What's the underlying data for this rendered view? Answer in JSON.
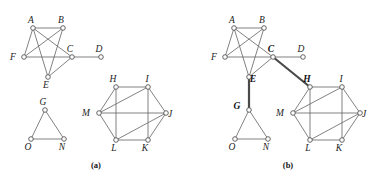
{
  "figure": {
    "width": 384,
    "height": 179,
    "background": "#ffffff",
    "edge_color": "#6b6b6b",
    "bold_edge_color": "#4a4a4a",
    "node_fill": "#ffffff",
    "node_stroke": "#555555",
    "label_color": "#1d1d1d"
  },
  "panels": [
    {
      "id": "panel-a",
      "caption": "(a)",
      "caption_pos": {
        "x": 96,
        "y": 168
      },
      "components": [
        {
          "id": "component-a-abcdef",
          "nodes": [
            {
              "id": "A",
              "label": "A",
              "x": 33,
              "y": 28,
              "bold": false,
              "label_dx": -2,
              "label_dy": -5
            },
            {
              "id": "B",
              "label": "B",
              "x": 63,
              "y": 28,
              "bold": false,
              "label_dx": -2,
              "label_dy": -5
            },
            {
              "id": "C",
              "label": "C",
              "x": 72,
              "y": 57,
              "bold": false,
              "label_dx": -2,
              "label_dy": -5
            },
            {
              "id": "D",
              "label": "D",
              "x": 101,
              "y": 57,
              "bold": false,
              "label_dx": -2,
              "label_dy": -5
            },
            {
              "id": "E",
              "label": "E",
              "x": 48,
              "y": 77,
              "bold": false,
              "label_dx": -2,
              "label_dy": 11
            },
            {
              "id": "F",
              "label": "F",
              "x": 24,
              "y": 57,
              "bold": false,
              "label_dx": -11,
              "label_dy": 3
            }
          ],
          "edges": [
            {
              "from": "A",
              "to": "B",
              "bold": false
            },
            {
              "from": "A",
              "to": "F",
              "bold": false
            },
            {
              "from": "A",
              "to": "C",
              "bold": false
            },
            {
              "from": "A",
              "to": "E",
              "bold": false
            },
            {
              "from": "B",
              "to": "F",
              "bold": false
            },
            {
              "from": "B",
              "to": "E",
              "bold": false
            },
            {
              "from": "F",
              "to": "C",
              "bold": false
            },
            {
              "from": "C",
              "to": "E",
              "bold": false
            },
            {
              "from": "C",
              "to": "D",
              "bold": false
            }
          ]
        },
        {
          "id": "component-a-gon",
          "nodes": [
            {
              "id": "G",
              "label": "G",
              "x": 45,
              "y": 110,
              "bold": false,
              "label_dx": -2,
              "label_dy": -5
            },
            {
              "id": "O",
              "label": "O",
              "x": 31,
              "y": 139,
              "bold": false,
              "label_dx": -3,
              "label_dy": 11
            },
            {
              "id": "N",
              "label": "N",
              "x": 64,
              "y": 139,
              "bold": false,
              "label_dx": -2,
              "label_dy": 11
            }
          ],
          "edges": [
            {
              "from": "G",
              "to": "O",
              "bold": false
            },
            {
              "from": "G",
              "to": "N",
              "bold": false
            },
            {
              "from": "O",
              "to": "N",
              "bold": false
            }
          ]
        },
        {
          "id": "component-a-hexagon",
          "nodes": [
            {
              "id": "H",
              "label": "H",
              "x": 116,
              "y": 87,
              "bold": false,
              "label_dx": -3,
              "label_dy": -5
            },
            {
              "id": "I",
              "label": "I",
              "x": 148,
              "y": 87,
              "bold": false,
              "label_dx": -1,
              "label_dy": -5
            },
            {
              "id": "J",
              "label": "J",
              "x": 166,
              "y": 113,
              "bold": false,
              "label_dx": 4,
              "label_dy": 4
            },
            {
              "id": "K",
              "label": "K",
              "x": 148,
              "y": 140,
              "bold": false,
              "label_dx": -3,
              "label_dy": 11
            },
            {
              "id": "L",
              "label": "L",
              "x": 116,
              "y": 140,
              "bold": false,
              "label_dx": -2,
              "label_dy": 11
            },
            {
              "id": "M",
              "label": "M",
              "x": 99,
              "y": 113,
              "bold": false,
              "label_dx": -13,
              "label_dy": 3
            }
          ],
          "edges": [
            {
              "from": "H",
              "to": "I",
              "bold": false
            },
            {
              "from": "I",
              "to": "J",
              "bold": false
            },
            {
              "from": "J",
              "to": "K",
              "bold": false
            },
            {
              "from": "K",
              "to": "L",
              "bold": false
            },
            {
              "from": "L",
              "to": "M",
              "bold": false
            },
            {
              "from": "M",
              "to": "H",
              "bold": false
            },
            {
              "from": "M",
              "to": "I",
              "bold": false
            },
            {
              "from": "M",
              "to": "J",
              "bold": false
            },
            {
              "from": "H",
              "to": "L",
              "bold": false
            },
            {
              "from": "I",
              "to": "K",
              "bold": false
            },
            {
              "from": "L",
              "to": "J",
              "bold": false
            }
          ]
        }
      ]
    },
    {
      "id": "panel-b",
      "caption": "(b)",
      "caption_pos": {
        "x": 288,
        "y": 168
      },
      "components": [
        {
          "id": "component-b-tree",
          "nodes": [
            {
              "id": "A",
              "label": "A",
              "x": 234,
              "y": 28,
              "bold": false,
              "label_dx": -2,
              "label_dy": -5
            },
            {
              "id": "B",
              "label": "B",
              "x": 264,
              "y": 28,
              "bold": false,
              "label_dx": -2,
              "label_dy": -5
            },
            {
              "id": "C",
              "label": "C",
              "x": 273,
              "y": 57,
              "bold": true,
              "label_dx": -2,
              "label_dy": -5
            },
            {
              "id": "D",
              "label": "D",
              "x": 303,
              "y": 57,
              "bold": false,
              "label_dx": -2,
              "label_dy": -5
            },
            {
              "id": "E",
              "label": "E",
              "x": 249,
              "y": 77,
              "bold": true,
              "label_dx": 4,
              "label_dy": 5
            },
            {
              "id": "F",
              "label": "F",
              "x": 225,
              "y": 57,
              "bold": false,
              "label_dx": -11,
              "label_dy": 3
            },
            {
              "id": "G",
              "label": "G",
              "x": 249,
              "y": 110,
              "bold": true,
              "label_dx": -12,
              "label_dy": -1
            },
            {
              "id": "O",
              "label": "O",
              "x": 235,
              "y": 139,
              "bold": false,
              "label_dx": -3,
              "label_dy": 11
            },
            {
              "id": "N",
              "label": "N",
              "x": 268,
              "y": 139,
              "bold": false,
              "label_dx": -2,
              "label_dy": 11
            },
            {
              "id": "H",
              "label": "H",
              "x": 310,
              "y": 87,
              "bold": true,
              "label_dx": -3,
              "label_dy": -5
            },
            {
              "id": "I",
              "label": "I",
              "x": 342,
              "y": 87,
              "bold": false,
              "label_dx": -1,
              "label_dy": -5
            },
            {
              "id": "J",
              "label": "J",
              "x": 360,
              "y": 113,
              "bold": false,
              "label_dx": 4,
              "label_dy": 4
            },
            {
              "id": "K",
              "label": "K",
              "x": 342,
              "y": 140,
              "bold": false,
              "label_dx": -3,
              "label_dy": 11
            },
            {
              "id": "L",
              "label": "L",
              "x": 310,
              "y": 140,
              "bold": false,
              "label_dx": -2,
              "label_dy": 11
            },
            {
              "id": "M",
              "label": "M",
              "x": 293,
              "y": 113,
              "bold": false,
              "label_dx": -13,
              "label_dy": 3
            }
          ],
          "edges": [
            {
              "from": "A",
              "to": "B",
              "bold": false
            },
            {
              "from": "A",
              "to": "F",
              "bold": false
            },
            {
              "from": "A",
              "to": "C",
              "bold": false
            },
            {
              "from": "A",
              "to": "E",
              "bold": false
            },
            {
              "from": "B",
              "to": "F",
              "bold": false
            },
            {
              "from": "B",
              "to": "E",
              "bold": false
            },
            {
              "from": "F",
              "to": "C",
              "bold": false
            },
            {
              "from": "C",
              "to": "E",
              "bold": false
            },
            {
              "from": "C",
              "to": "D",
              "bold": false
            },
            {
              "from": "C",
              "to": "H",
              "bold": true
            },
            {
              "from": "E",
              "to": "G",
              "bold": true
            },
            {
              "from": "G",
              "to": "O",
              "bold": false
            },
            {
              "from": "G",
              "to": "N",
              "bold": false
            },
            {
              "from": "O",
              "to": "N",
              "bold": false
            },
            {
              "from": "H",
              "to": "I",
              "bold": false
            },
            {
              "from": "I",
              "to": "J",
              "bold": false
            },
            {
              "from": "J",
              "to": "K",
              "bold": false
            },
            {
              "from": "K",
              "to": "L",
              "bold": false
            },
            {
              "from": "L",
              "to": "M",
              "bold": false
            },
            {
              "from": "M",
              "to": "H",
              "bold": false
            },
            {
              "from": "M",
              "to": "I",
              "bold": false
            },
            {
              "from": "M",
              "to": "J",
              "bold": false
            },
            {
              "from": "H",
              "to": "L",
              "bold": false
            },
            {
              "from": "I",
              "to": "K",
              "bold": false
            },
            {
              "from": "L",
              "to": "J",
              "bold": false
            }
          ]
        }
      ]
    }
  ]
}
